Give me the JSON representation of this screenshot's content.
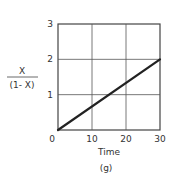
{
  "chart_data": {
    "type": "line",
    "title": "",
    "panel_label": "(g)",
    "xlabel": "Time",
    "ylabel_numerator": "X",
    "ylabel_denominator": "(1- X)",
    "ylabel": "X/(1-X)",
    "xlim": [
      0,
      30
    ],
    "ylim": [
      0,
      3
    ],
    "xticks": [
      "0",
      "10",
      "20",
      "30"
    ],
    "yticks": [
      "1",
      "2",
      "3"
    ],
    "grid": true,
    "legend": null,
    "series": [
      {
        "name": "X/(1-X)",
        "x": [
          0,
          30
        ],
        "y": [
          0,
          2
        ]
      }
    ]
  }
}
